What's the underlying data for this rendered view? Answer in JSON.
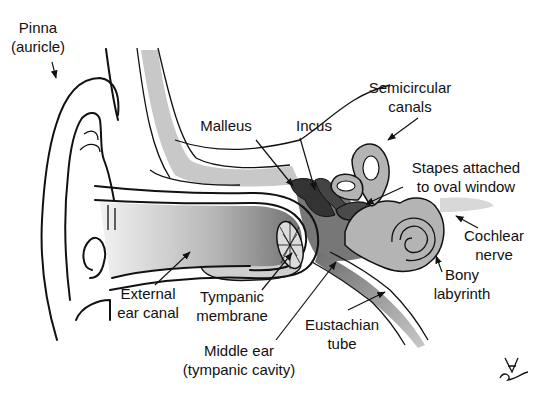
{
  "diagram": {
    "colors": {
      "background": "#ffffff",
      "line": "#111111",
      "bone_light": "#c8c8c8",
      "labyrinth": "#b4b4b4",
      "middle_ear": "#777777",
      "ossicles": "#3a3a3a",
      "canal_dark": "#8a8a8a",
      "canal_light": "#e6e6e6"
    },
    "labels": {
      "pinna": {
        "line1": "Pinna",
        "line2": "(auricle)"
      },
      "malleus": {
        "line1": "Malleus"
      },
      "incus": {
        "line1": "Incus"
      },
      "semicircular": {
        "line1": "Semicircular",
        "line2": "canals"
      },
      "stapes": {
        "line1": "Stapes attached",
        "line2": "to oval window"
      },
      "cochlear_nerve": {
        "line1": "Cochlear",
        "line2": "nerve"
      },
      "bony_labyrinth": {
        "line1": "Bony",
        "line2": "labyrinth"
      },
      "external_canal": {
        "line1": "External",
        "line2": "ear canal"
      },
      "tympanic_membrane": {
        "line1": "Tympanic",
        "line2": "membrane"
      },
      "eustachian": {
        "line1": "Eustachian",
        "line2": "tube"
      },
      "middle_ear": {
        "line1": "Middle ear",
        "line2": "(tympanic cavity)"
      }
    },
    "signature": "artist-signature"
  }
}
